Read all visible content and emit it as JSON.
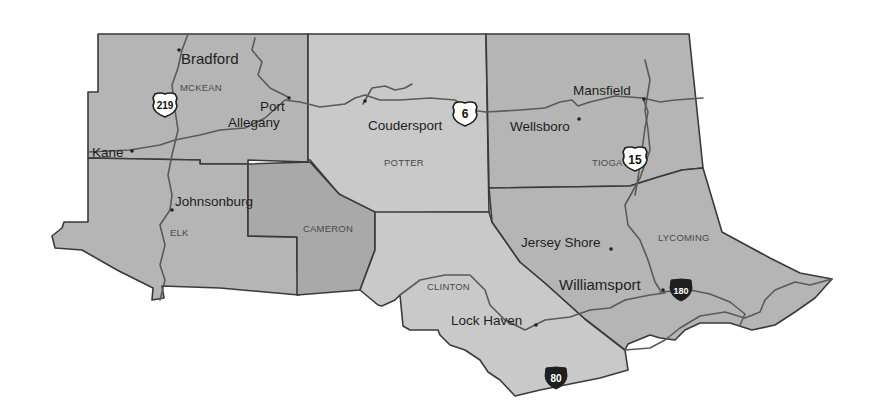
{
  "map": {
    "region": "North Central Pennsylvania",
    "counties": [
      {
        "id": "mckean",
        "label": "MCKEAN"
      },
      {
        "id": "potter",
        "label": "POTTER"
      },
      {
        "id": "tioga",
        "label": "TIOGA"
      },
      {
        "id": "elk",
        "label": "ELK"
      },
      {
        "id": "cameron",
        "label": "CAMERON"
      },
      {
        "id": "clinton",
        "label": "CLINTON"
      },
      {
        "id": "lycoming",
        "label": "LYCOMING"
      }
    ],
    "cities": [
      {
        "id": "bradford",
        "label": "Bradford"
      },
      {
        "id": "port-allegany-1",
        "label": "Port"
      },
      {
        "id": "port-allegany-2",
        "label": "Allegany"
      },
      {
        "id": "kane",
        "label": "Kane"
      },
      {
        "id": "coudersport",
        "label": "Coudersport"
      },
      {
        "id": "wellsboro",
        "label": "Wellsboro"
      },
      {
        "id": "mansfield",
        "label": "Mansfield"
      },
      {
        "id": "johnsonburg",
        "label": "Johnsonburg"
      },
      {
        "id": "jersey-shore",
        "label": "Jersey Shore"
      },
      {
        "id": "williamsport",
        "label": "Williamsport"
      },
      {
        "id": "lock-haven",
        "label": "Lock Haven"
      }
    ],
    "highways": [
      {
        "id": "us-219",
        "type": "us-route",
        "label": "219"
      },
      {
        "id": "us-6",
        "type": "us-route",
        "label": "6"
      },
      {
        "id": "us-15",
        "type": "us-route",
        "label": "15"
      },
      {
        "id": "i-180",
        "type": "interstate",
        "label": "180"
      },
      {
        "id": "i-80",
        "type": "interstate",
        "label": "80"
      }
    ],
    "colors": {
      "county_light": "#c9c9c9",
      "county_mid": "#b5b5b5",
      "county_dark": "#a9a9a9",
      "border": "#3a3a3a",
      "road": "#5a5a5a"
    }
  }
}
